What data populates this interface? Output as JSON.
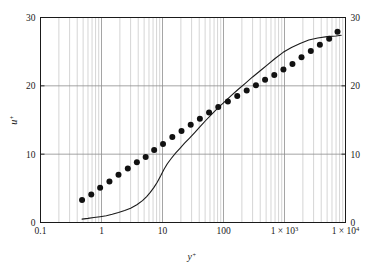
{
  "chart_data": {
    "type": "line",
    "title": "",
    "subtitle": "",
    "xlabel": "y+",
    "ylabel": "u+",
    "xscale": "log",
    "yscale": "linear",
    "xlim": [
      0.1,
      10000
    ],
    "ylim": [
      0,
      30
    ],
    "grid": "major-and-minor-vertical, major-horizontal",
    "legend": "none",
    "x_tick_labels": [
      "0.1",
      "1",
      "10",
      "100",
      "1 × 10³",
      "1 × 10⁴"
    ],
    "x_tick_values": [
      0.1,
      1,
      10,
      100,
      1000,
      10000
    ],
    "y_tick_labels": [
      "0",
      "10",
      "20",
      "30"
    ],
    "y_tick_values": [
      0,
      10,
      20,
      30
    ],
    "right_axis_tick_labels": [
      "0",
      "10",
      "20",
      "30"
    ],
    "y_gridline_values": [
      10,
      20
    ],
    "series": [
      {
        "name": "model-curve",
        "style": "solid-line",
        "color": "#1a1a1a",
        "x": [
          0.48,
          0.6,
          0.75,
          0.95,
          1.2,
          1.5,
          1.9,
          2.4,
          3.0,
          3.8,
          4.7,
          5.5,
          6.3,
          7.2,
          8.2,
          9.3,
          10.6,
          12.0,
          14.0,
          16.5,
          19.5,
          23.0,
          28.0,
          34.0,
          42.0,
          52.0,
          65.0,
          82.0,
          105.0,
          135.0,
          175.0,
          230.0,
          300.0,
          400.0,
          530.0,
          700.0,
          950.0,
          1300.0,
          1800.0,
          2500.0,
          3500.0,
          5000.0,
          7000.0,
          8500.0
        ],
        "y": [
          0.5,
          0.6,
          0.72,
          0.85,
          1.0,
          1.2,
          1.45,
          1.75,
          2.1,
          2.6,
          3.2,
          3.8,
          4.4,
          5.1,
          5.9,
          6.8,
          7.8,
          8.6,
          9.4,
          10.2,
          10.9,
          11.6,
          12.4,
          13.2,
          14.1,
          15.0,
          15.9,
          16.8,
          17.7,
          18.6,
          19.5,
          20.4,
          21.3,
          22.2,
          23.1,
          24.0,
          24.9,
          25.6,
          26.2,
          26.7,
          27.0,
          27.2,
          27.3,
          27.4
        ]
      },
      {
        "name": "experimental-data",
        "style": "filled-circles",
        "color": "#111111",
        "marker_size_px": 3.0,
        "x": [
          0.48,
          0.68,
          0.95,
          1.35,
          1.9,
          2.7,
          3.8,
          5.3,
          7.3,
          10.2,
          14.5,
          20.5,
          29.0,
          41.0,
          58.0,
          82.0,
          118.0,
          168.0,
          240.0,
          340.0,
          480.0,
          680.0,
          960.0,
          1350.0,
          1900.0,
          2700.0,
          3800.0,
          5400.0,
          7400.0
        ],
        "y": [
          3.3,
          4.1,
          5.1,
          6.0,
          7.0,
          7.9,
          8.8,
          9.6,
          10.6,
          11.5,
          12.5,
          13.4,
          14.3,
          15.2,
          16.1,
          16.9,
          17.7,
          18.5,
          19.3,
          20.1,
          20.9,
          21.6,
          22.4,
          23.2,
          24.2,
          25.1,
          26.0,
          26.9,
          27.9
        ]
      }
    ]
  },
  "axes": {
    "left_label": "u",
    "left_label_sup": "+",
    "bottom_label": "y",
    "bottom_label_sup": "+"
  }
}
